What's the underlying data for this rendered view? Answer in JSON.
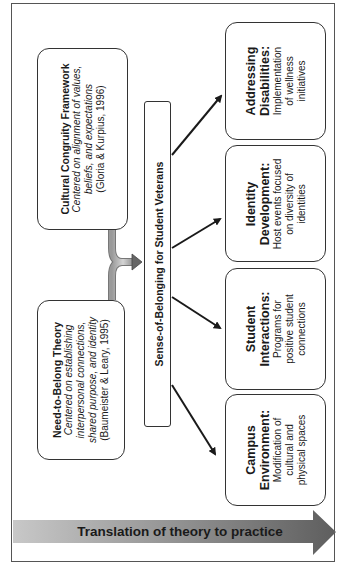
{
  "theories": [
    {
      "title": "Cultural Congruity Framework",
      "lines": [
        "Centered on alignment of values,",
        "beliefs, and expectations"
      ],
      "citation": "(Gloria & Kurpius, 1996)"
    },
    {
      "title": "Need-to-Belong Theory",
      "lines": [
        "Centered on establishing",
        "interpersonal connections,",
        "shared purpose, and identity"
      ],
      "citation": "(Baumeister & Leary, 1995)"
    }
  ],
  "central": {
    "label": "Sense-of-Belonging for Student Veterans"
  },
  "practices": [
    {
      "title_lines": [
        "Addressing",
        "Disabilities:"
      ],
      "lines": [
        "Implementation",
        "of wellness",
        "initiatives"
      ]
    },
    {
      "title_lines": [
        "Identity",
        "Development:"
      ],
      "lines": [
        "Host events focused",
        "on diversity of",
        "identities"
      ]
    },
    {
      "title_lines": [
        "Student",
        "Interactions:"
      ],
      "lines": [
        "Programs for",
        "positive student",
        "connections"
      ]
    },
    {
      "title_lines": [
        "Campus",
        "Environment:"
      ],
      "lines": [
        "Modification of",
        "cultural and",
        "physical spaces"
      ]
    }
  ],
  "footer_arrow": {
    "label": "Translation of theory to practice"
  },
  "colors": {
    "border": "#333333",
    "arrow_light": "#c4c4c4",
    "arrow_dark": "#6a6a6a",
    "text": "#1a1a1a"
  }
}
